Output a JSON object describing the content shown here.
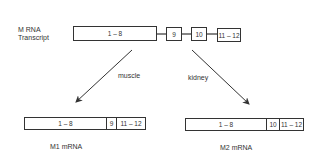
{
  "transcript": {
    "label_line1": "M RNA",
    "label_line2": "Transcript",
    "exons": [
      {
        "label": "1 – 8"
      },
      {
        "label": "9"
      },
      {
        "label": "10"
      },
      {
        "label": "11 – 12"
      }
    ]
  },
  "pathways": [
    {
      "tissue": "muscle",
      "direction": "left"
    },
    {
      "tissue": "kidney",
      "direction": "right"
    }
  ],
  "products": [
    {
      "name": "M1 mRNA",
      "segments": [
        {
          "label": "1 – 8"
        },
        {
          "label": "9"
        },
        {
          "label": "11 – 12"
        }
      ]
    },
    {
      "name": "M2 mRNA",
      "segments": [
        {
          "label": "1 – 8"
        },
        {
          "label": "10"
        },
        {
          "label": "11 – 12"
        }
      ]
    }
  ],
  "colors": {
    "line": "#333333",
    "background": "#ffffff"
  }
}
